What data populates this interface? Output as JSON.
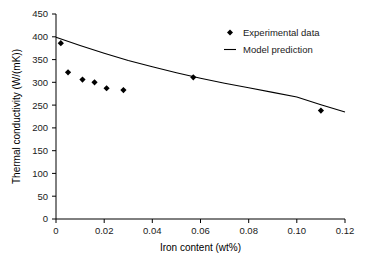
{
  "chart_data": {
    "type": "scatter",
    "title": "",
    "xlabel": "Iron content (wt%)",
    "ylabel": "Thermal conductivity (W/(mK))",
    "xlim": [
      0,
      0.12
    ],
    "ylim": [
      0,
      450
    ],
    "xticks": [
      "0",
      "0.02",
      "0.04",
      "0.06",
      "0.08",
      "0.10",
      "0.12"
    ],
    "xtick_values": [
      0,
      0.02,
      0.04,
      0.06,
      0.08,
      0.1,
      0.12
    ],
    "yticks": [
      "0",
      "50",
      "100",
      "150",
      "200",
      "250",
      "300",
      "350",
      "400",
      "450"
    ],
    "ytick_values": [
      0,
      50,
      100,
      150,
      200,
      250,
      300,
      350,
      400,
      450
    ],
    "grid": false,
    "legend_position": "top-right",
    "series": [
      {
        "name": "Experimental data",
        "type": "scatter",
        "marker": "diamond",
        "color": "#000000",
        "x": [
          0.002,
          0.005,
          0.011,
          0.016,
          0.021,
          0.028,
          0.057,
          0.11
        ],
        "y": [
          386,
          322,
          306,
          300,
          287,
          283,
          311,
          238
        ]
      },
      {
        "name": "Model prediction",
        "type": "line",
        "color": "#000000",
        "x": [
          0,
          0.01,
          0.02,
          0.03,
          0.04,
          0.05,
          0.06,
          0.07,
          0.08,
          0.09,
          0.1,
          0.11,
          0.12
        ],
        "y": [
          399,
          381,
          364,
          348,
          334,
          321,
          309,
          298,
          288,
          278,
          268,
          251,
          235
        ]
      }
    ]
  },
  "legend": {
    "entries": [
      {
        "label": "Experimental data",
        "marker": "diamond"
      },
      {
        "label": "Model prediction",
        "marker": "line"
      }
    ]
  },
  "axes": {
    "x_title": "Iron content (wt%)",
    "y_title": "Thermal conductivity (W/(mK))"
  }
}
